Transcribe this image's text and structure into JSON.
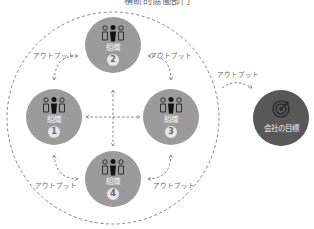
{
  "title": "横断的協働部門",
  "organizations": [
    {
      "label": "組織",
      "number": "1"
    },
    {
      "label": "組織",
      "number": "2"
    },
    {
      "label": "組織",
      "number": "3"
    },
    {
      "label": "組織",
      "number": "4"
    }
  ],
  "goal": {
    "label": "会社の目標",
    "icon": "target-icon"
  },
  "output_labels": {
    "top_left": "アウトプット",
    "top_right": "アウトプット",
    "bottom_left": "アウトプット",
    "bottom_right": "アウトプット",
    "to_goal": "アウトプット"
  },
  "colors": {
    "org_fill": "#9b9b9b",
    "goal_fill": "#585858",
    "dashed_line": "#777777",
    "text": "#666666"
  }
}
